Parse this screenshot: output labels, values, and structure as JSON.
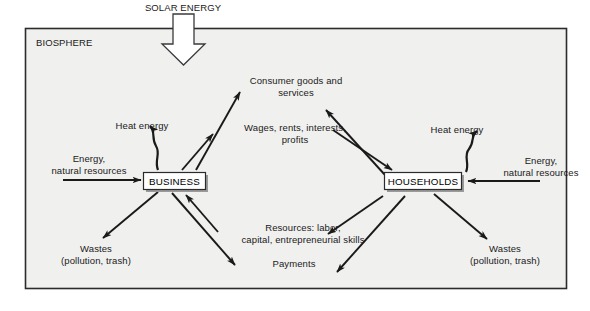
{
  "diagram": {
    "solar_energy_label": "SOLAR ENERGY",
    "biosphere_label": "BIOSPHERE",
    "sectors": {
      "business": "BUSINESS",
      "households": "HOUSEHOLDS"
    },
    "flows": {
      "consumer_goods": "Consumer goods and\nservices",
      "wages": "Wages, rents, interests,\nprofits",
      "resources": "Resources: labor,\ncapital, entrepreneurial skills",
      "payments": "Payments"
    },
    "left_side": {
      "heat_energy": "Heat energy",
      "inputs": "Energy,\nnatural resources",
      "wastes": "Wastes\n(pollution, trash)"
    },
    "right_side": {
      "heat_energy": "Heat energy",
      "inputs": "Energy,\nnatural resources",
      "wastes": "Wastes\n(pollution, trash)"
    },
    "colors": {
      "background": "#ffffff",
      "biosphere_fill": "#f0f0ee",
      "border": "#2b2b2b",
      "arrow": "#1a1a1a",
      "box_fill": "#ffffff",
      "box_shadow": "#9a9a9a",
      "text": "#1a1a1a"
    }
  }
}
